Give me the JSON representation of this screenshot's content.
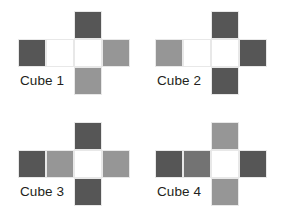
{
  "page": {
    "background_color": "#ffffff",
    "width": 286,
    "height": 223
  },
  "palette": {
    "dark_gray": "#565656",
    "medium_gray": "#969696",
    "white": "#ffffff",
    "cell_border": "#e8e8e8",
    "label_color": "#231f20"
  },
  "cubes": [
    {
      "id": "cube-1",
      "label": "Cube 1",
      "position": {
        "left": 18,
        "top": 11
      },
      "faces": {
        "top": "#565656",
        "row": [
          "#565656",
          "#ffffff",
          "#ffffff",
          "#969696"
        ],
        "bottom": "#969696"
      },
      "face_names": {
        "top": "dark gray",
        "row": [
          "dark gray",
          "white",
          "white",
          "medium gray"
        ],
        "bottom": "medium gray"
      }
    },
    {
      "id": "cube-2",
      "label": "Cube 2",
      "position": {
        "left": 155,
        "top": 11
      },
      "faces": {
        "top": "#565656",
        "row": [
          "#969696",
          "#ffffff",
          "#ffffff",
          "#565656"
        ],
        "bottom": "#565656"
      },
      "face_names": {
        "top": "dark gray",
        "row": [
          "medium gray",
          "white",
          "white",
          "dark gray"
        ],
        "bottom": "dark gray"
      }
    },
    {
      "id": "cube-3",
      "label": "Cube 3",
      "position": {
        "left": 18,
        "top": 122
      },
      "faces": {
        "top": "#565656",
        "row": [
          "#565656",
          "#969696",
          "#ffffff",
          "#969696"
        ],
        "bottom": "#565656"
      },
      "face_names": {
        "top": "dark gray",
        "row": [
          "dark gray",
          "medium gray",
          "white",
          "medium gray"
        ],
        "bottom": "dark gray"
      }
    },
    {
      "id": "cube-4",
      "label": "Cube 4",
      "position": {
        "left": 155,
        "top": 122
      },
      "faces": {
        "top": "#969696",
        "row": [
          "#565656",
          "#737373",
          "#ffffff",
          "#565656"
        ],
        "bottom": "#969696"
      },
      "face_names": {
        "top": "medium gray",
        "row": [
          "dark gray",
          "medium dark gray",
          "white",
          "dark gray"
        ],
        "bottom": "medium gray"
      }
    }
  ]
}
